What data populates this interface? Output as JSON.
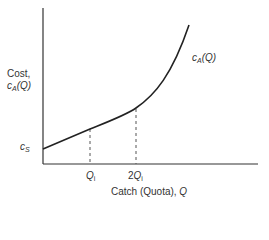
{
  "diagram": {
    "y_axis_label_line1": "Cost,",
    "y_axis_label_line2_var": "c",
    "y_axis_label_line2_sub": "A",
    "y_axis_label_line2_arg": "(Q)",
    "y_tick_label_var": "c",
    "y_tick_label_sub": "S",
    "curve_label_var": "c",
    "curve_label_sub": "A",
    "curve_label_arg": "(Q)",
    "x_tick1_var": "Q",
    "x_tick1_sub": "i",
    "x_tick2_prefix": "2",
    "x_tick2_var": "Q",
    "x_tick2_sub": "i",
    "x_axis_label_text": "Catch (Quota), ",
    "x_axis_label_var": "Q"
  },
  "colors": {
    "axis": "#333333",
    "curve": "#222222",
    "dashed": "#555555"
  }
}
